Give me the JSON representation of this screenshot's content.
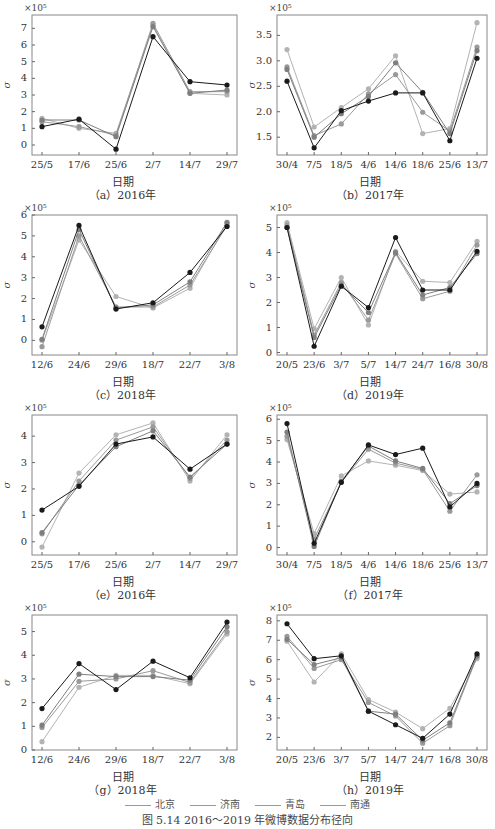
{
  "xlabel": "日期",
  "ylabel_symbol": "σ",
  "legend": [
    {
      "name": "北京",
      "color": "#b3b3b3"
    },
    {
      "name": "济南",
      "color": "#9a9a9a"
    },
    {
      "name": "青岛",
      "color": "#7f7f7f"
    },
    {
      "name": "南通",
      "color": "#1a1a1a"
    }
  ],
  "figure_title": "图 5.14   2016～2019 年微博数据分布径向",
  "chart_data": [
    {
      "type": "line",
      "id": "a",
      "caption": "（a）2016年",
      "exponent_label": "×10⁵",
      "categories": [
        "25/5",
        "17/6",
        "25/6",
        "2/7",
        "14/7",
        "29/7"
      ],
      "ylim": [
        -0.6,
        7.8
      ],
      "yticks": [
        0,
        1,
        2,
        3,
        4,
        5,
        6,
        7
      ],
      "ytick_labels": [
        "0",
        "1",
        "2",
        "3",
        "4",
        "5",
        "6",
        "7"
      ],
      "series": [
        {
          "name": "北京",
          "values": [
            1.6,
            1.0,
            0.7,
            7.2,
            3.1,
            3.0
          ]
        },
        {
          "name": "济南",
          "values": [
            1.4,
            1.1,
            0.6,
            7.3,
            3.2,
            3.2
          ]
        },
        {
          "name": "青岛",
          "values": [
            1.5,
            1.5,
            0.5,
            7.1,
            3.1,
            3.3
          ]
        },
        {
          "name": "南通",
          "values": [
            1.1,
            1.55,
            -0.25,
            6.5,
            3.8,
            3.6
          ]
        }
      ]
    },
    {
      "type": "line",
      "id": "b",
      "caption": "（b）2017年",
      "exponent_label": "×10⁵",
      "categories": [
        "30/4",
        "7/5",
        "18/5",
        "4/6",
        "14/6",
        "18/6",
        "25/6",
        "13/7"
      ],
      "ylim": [
        1.15,
        3.9
      ],
      "yticks": [
        1.5,
        2.0,
        2.5,
        3.0,
        3.5
      ],
      "ytick_labels": [
        "1.5",
        "2.0",
        "2.5",
        "3.0",
        "3.5"
      ],
      "series": [
        {
          "name": "北京",
          "values": [
            3.22,
            1.7,
            2.08,
            2.45,
            3.1,
            1.57,
            1.67,
            3.75
          ]
        },
        {
          "name": "济南",
          "values": [
            2.88,
            1.53,
            1.76,
            2.35,
            2.73,
            1.99,
            1.62,
            3.27
          ]
        },
        {
          "name": "青岛",
          "values": [
            2.83,
            1.5,
            1.96,
            2.3,
            2.96,
            2.38,
            1.57,
            3.2
          ]
        },
        {
          "name": "南通",
          "values": [
            2.6,
            1.29,
            2.02,
            2.21,
            2.37,
            2.37,
            1.43,
            3.05
          ]
        }
      ]
    },
    {
      "type": "line",
      "id": "c",
      "caption": "（c）2018年",
      "exponent_label": "×10⁵",
      "categories": [
        "12/6",
        "24/6",
        "29/6",
        "18/7",
        "22/7",
        "3/8"
      ],
      "ylim": [
        -0.7,
        6.0
      ],
      "yticks": [
        0,
        1,
        2,
        3,
        4,
        5,
        6
      ],
      "ytick_labels": [
        "0",
        "1",
        "2",
        "3",
        "4",
        "5",
        "6"
      ],
      "series": [
        {
          "name": "北京",
          "values": [
            0.0,
            4.8,
            2.1,
            1.55,
            2.5,
            5.6
          ]
        },
        {
          "name": "济南",
          "values": [
            -0.3,
            5.0,
            1.6,
            1.6,
            2.65,
            5.5
          ]
        },
        {
          "name": "青岛",
          "values": [
            0.05,
            5.3,
            1.55,
            1.7,
            2.8,
            5.65
          ]
        },
        {
          "name": "南通",
          "values": [
            0.65,
            5.5,
            1.5,
            1.8,
            3.25,
            5.45
          ]
        }
      ]
    },
    {
      "type": "line",
      "id": "d",
      "caption": "（d）2019年",
      "exponent_label": "×10⁵",
      "categories": [
        "20/5",
        "23/6",
        "3/7",
        "5/7",
        "14/7",
        "24/7",
        "16/8",
        "30/8"
      ],
      "ylim": [
        -0.1,
        5.5
      ],
      "yticks": [
        0,
        1,
        2,
        3,
        4,
        5
      ],
      "ytick_labels": [
        "0",
        "1",
        "2",
        "3",
        "4",
        "5"
      ],
      "series": [
        {
          "name": "北京",
          "values": [
            5.2,
            0.95,
            3.0,
            1.1,
            4.05,
            2.85,
            2.8,
            4.45
          ]
        },
        {
          "name": "济南",
          "values": [
            5.1,
            0.7,
            2.8,
            1.3,
            3.95,
            2.15,
            2.45,
            4.3
          ]
        },
        {
          "name": "青岛",
          "values": [
            5.0,
            0.6,
            2.7,
            1.6,
            4.0,
            2.3,
            2.6,
            3.95
          ]
        },
        {
          "name": "南通",
          "values": [
            5.0,
            0.25,
            2.65,
            1.8,
            4.6,
            2.5,
            2.5,
            4.05
          ]
        }
      ]
    },
    {
      "type": "line",
      "id": "e",
      "caption": "（e）2016年",
      "exponent_label": "×10⁵",
      "categories": [
        "25/5",
        "17/6",
        "25/6",
        "2/7",
        "14/7",
        "29/7"
      ],
      "ylim": [
        -0.5,
        4.8
      ],
      "yticks": [
        0,
        1,
        2,
        3,
        4
      ],
      "ytick_labels": [
        "0",
        "1",
        "2",
        "3",
        "4"
      ],
      "series": [
        {
          "name": "北京",
          "values": [
            -0.2,
            2.6,
            4.05,
            4.5,
            2.3,
            4.05
          ]
        },
        {
          "name": "济南",
          "values": [
            0.3,
            2.3,
            3.85,
            4.35,
            2.4,
            3.85
          ]
        },
        {
          "name": "青岛",
          "values": [
            0.35,
            2.15,
            3.6,
            4.2,
            2.45,
            3.7
          ]
        },
        {
          "name": "南通",
          "values": [
            1.2,
            2.1,
            3.7,
            3.97,
            2.75,
            3.7
          ]
        }
      ]
    },
    {
      "type": "line",
      "id": "f",
      "caption": "（f）2017年",
      "exponent_label": "×10⁵",
      "categories": [
        "30/4",
        "7/5",
        "18/5",
        "4/6",
        "14/6",
        "18/6",
        "25/6",
        "13/7"
      ],
      "ylim": [
        -0.35,
        6.2
      ],
      "yticks": [
        0,
        1,
        2,
        3,
        4,
        5,
        6
      ],
      "ytick_labels": [
        "0",
        "1",
        "2",
        "3",
        "4",
        "5",
        "6"
      ],
      "series": [
        {
          "name": "北京",
          "values": [
            5.05,
            0.65,
            3.35,
            4.05,
            3.85,
            3.6,
            2.5,
            2.6
          ]
        },
        {
          "name": "济南",
          "values": [
            5.2,
            0.4,
            3.05,
            4.6,
            3.95,
            3.65,
            1.7,
            3.4
          ]
        },
        {
          "name": "青岛",
          "values": [
            5.4,
            0.05,
            3.1,
            4.75,
            4.05,
            3.7,
            2.05,
            2.9
          ]
        },
        {
          "name": "南通",
          "values": [
            5.8,
            0.2,
            3.05,
            4.8,
            4.35,
            4.65,
            1.9,
            3.0
          ]
        }
      ]
    },
    {
      "type": "line",
      "id": "g",
      "caption": "（g）2018年",
      "exponent_label": "×10⁵",
      "categories": [
        "12/6",
        "24/6",
        "29/6",
        "18/7",
        "22/7",
        "3/8"
      ],
      "ylim": [
        0,
        5.7
      ],
      "yticks": [
        0,
        1,
        2,
        3,
        4,
        5
      ],
      "ytick_labels": [
        "0",
        "1",
        "2",
        "3",
        "4",
        "5"
      ],
      "series": [
        {
          "name": "北京",
          "values": [
            0.35,
            2.65,
            3.15,
            3.15,
            2.8,
            4.9
          ]
        },
        {
          "name": "济南",
          "values": [
            0.95,
            2.9,
            3.0,
            3.35,
            2.85,
            5.0
          ]
        },
        {
          "name": "青岛",
          "values": [
            1.05,
            3.2,
            3.1,
            3.1,
            2.95,
            5.2
          ]
        },
        {
          "name": "南通",
          "values": [
            1.75,
            3.65,
            2.55,
            3.75,
            3.05,
            5.4
          ]
        }
      ]
    },
    {
      "type": "line",
      "id": "h",
      "caption": "（h）2019年",
      "exponent_label": "×10⁵",
      "categories": [
        "20/5",
        "23/6",
        "3/7",
        "5/7",
        "14/7",
        "24/7",
        "16/8",
        "30/8"
      ],
      "ylim": [
        1.35,
        8.3
      ],
      "yticks": [
        2,
        3,
        4,
        5,
        6,
        7,
        8
      ],
      "ytick_labels": [
        "2",
        "3",
        "4",
        "5",
        "6",
        "7",
        "8"
      ],
      "series": [
        {
          "name": "北京",
          "values": [
            6.95,
            4.85,
            6.3,
            3.95,
            3.3,
            2.45,
            3.5,
            6.05
          ]
        },
        {
          "name": "济南",
          "values": [
            7.2,
            5.55,
            6.0,
            3.8,
            3.1,
            1.7,
            2.6,
            6.15
          ]
        },
        {
          "name": "青岛",
          "values": [
            7.05,
            5.75,
            6.1,
            3.35,
            3.2,
            1.85,
            2.75,
            6.2
          ]
        },
        {
          "name": "南通",
          "values": [
            7.85,
            6.05,
            6.2,
            3.35,
            2.65,
            1.95,
            3.2,
            6.3
          ]
        }
      ]
    }
  ]
}
